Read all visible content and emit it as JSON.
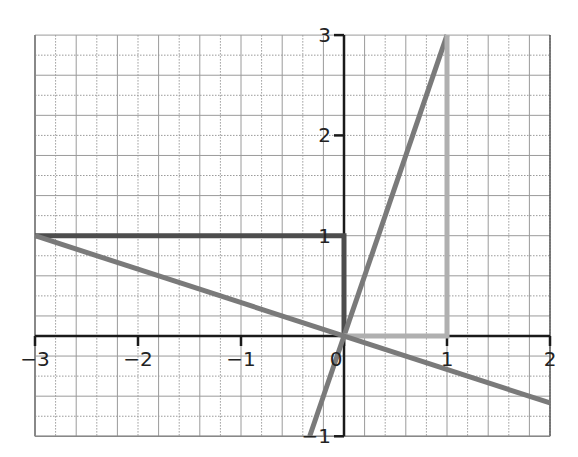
{
  "chart_data": {
    "type": "line",
    "title": "",
    "xlabel": "",
    "ylabel": "",
    "xlim": [
      -3,
      2
    ],
    "ylim": [
      -1,
      3
    ],
    "grid": true,
    "grid_minor_step": 0.2,
    "x_ticks": [
      -3,
      -2,
      -1,
      0,
      1,
      2
    ],
    "x_tick_labels": [
      "−3",
      "−2",
      "−1",
      "0",
      "1",
      "2"
    ],
    "y_ticks": [
      -1,
      1,
      2,
      3
    ],
    "y_tick_labels": [
      "−1",
      "1",
      "2",
      "3"
    ],
    "legend": null,
    "series": [
      {
        "name": "dark-path",
        "color": "#4d4d4d",
        "width": 5,
        "points": [
          [
            -3,
            1
          ],
          [
            0,
            1
          ],
          [
            0,
            0
          ]
        ]
      },
      {
        "name": "line-y-equals-3x",
        "color": "#7a7a7a",
        "width": 5,
        "points": [
          [
            -0.333,
            -1
          ],
          [
            1,
            3
          ]
        ]
      },
      {
        "name": "light-path",
        "color": "#b0b0b0",
        "width": 5,
        "points": [
          [
            0,
            0
          ],
          [
            1,
            0
          ],
          [
            1,
            3
          ]
        ]
      },
      {
        "name": "line-y-equals-neg-x-over-3",
        "color": "#7a7a7a",
        "width": 5,
        "points": [
          [
            -3,
            1
          ],
          [
            2,
            -0.667
          ]
        ]
      }
    ]
  },
  "layout": {
    "x_origin_px": 344,
    "y_origin_px": 336,
    "px_per_x": 103,
    "px_per_y": 100.3,
    "grid_color": "#9a9a9a",
    "axis_color": "#1a1a1a"
  }
}
